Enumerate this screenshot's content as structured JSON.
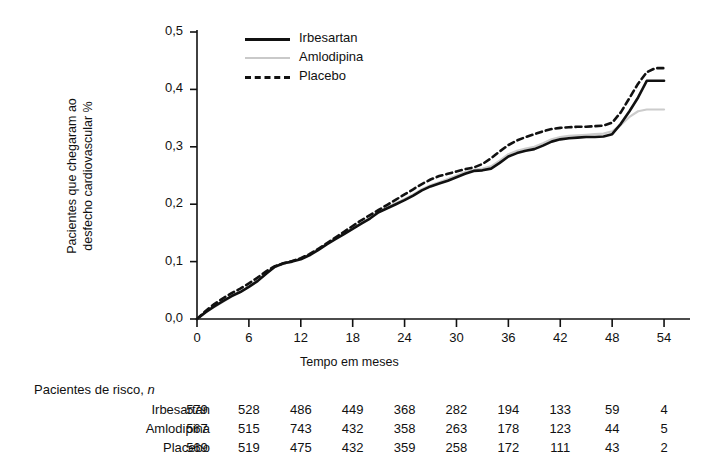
{
  "chart_data": {
    "type": "line",
    "title": "",
    "xlabel": "Tempo em meses",
    "ylabel": "Pacientes que chegaram ao\ndesfecho cardiovascular %",
    "xlim": [
      0,
      57
    ],
    "ylim": [
      0.0,
      0.5
    ],
    "xticks": [
      0,
      6,
      12,
      18,
      24,
      30,
      36,
      42,
      48,
      54
    ],
    "xtick_labels": [
      "0",
      "6",
      "12",
      "18",
      "24",
      "30",
      "36",
      "42",
      "48",
      "54"
    ],
    "yticks": [
      0.0,
      0.1,
      0.2,
      0.3,
      0.4,
      0.5
    ],
    "ytick_labels": [
      "0,0",
      "0,1",
      "0,2",
      "0,3",
      "0,4",
      "0,5"
    ],
    "grid": false,
    "legend_position": "top-left-inside",
    "series": [
      {
        "name": "Irbesartan",
        "style": "solid",
        "color": "#111111",
        "x": [
          0,
          1,
          2,
          3,
          4,
          5,
          6,
          7,
          8,
          9,
          10,
          11,
          12,
          13,
          14,
          15,
          16,
          17,
          18,
          19,
          20,
          21,
          22,
          23,
          24,
          25,
          26,
          27,
          28,
          29,
          30,
          31,
          32,
          33,
          34,
          35,
          36,
          37,
          38,
          39,
          40,
          41,
          42,
          43,
          44,
          45,
          46,
          47,
          48,
          49,
          50,
          51,
          52,
          53,
          54
        ],
        "y": [
          0.0,
          0.012,
          0.022,
          0.031,
          0.04,
          0.047,
          0.056,
          0.066,
          0.079,
          0.091,
          0.097,
          0.1,
          0.104,
          0.111,
          0.12,
          0.13,
          0.139,
          0.148,
          0.157,
          0.166,
          0.175,
          0.186,
          0.193,
          0.2,
          0.207,
          0.215,
          0.224,
          0.231,
          0.236,
          0.241,
          0.247,
          0.253,
          0.258,
          0.259,
          0.262,
          0.272,
          0.283,
          0.289,
          0.293,
          0.296,
          0.302,
          0.309,
          0.313,
          0.315,
          0.316,
          0.317,
          0.317,
          0.318,
          0.322,
          0.34,
          0.362,
          0.386,
          0.415,
          0.415,
          0.415
        ]
      },
      {
        "name": "Amlodipina",
        "style": "solid",
        "color": "#cccccc",
        "x": [
          0,
          1,
          2,
          3,
          4,
          5,
          6,
          7,
          8,
          9,
          10,
          11,
          12,
          13,
          14,
          15,
          16,
          17,
          18,
          19,
          20,
          21,
          22,
          23,
          24,
          25,
          26,
          27,
          28,
          29,
          30,
          31,
          32,
          33,
          34,
          35,
          36,
          37,
          38,
          39,
          40,
          41,
          42,
          43,
          44,
          45,
          46,
          47,
          48,
          49,
          50,
          51,
          52,
          53,
          54
        ],
        "y": [
          0.0,
          0.011,
          0.021,
          0.03,
          0.039,
          0.047,
          0.057,
          0.068,
          0.08,
          0.09,
          0.096,
          0.1,
          0.106,
          0.113,
          0.122,
          0.131,
          0.14,
          0.149,
          0.158,
          0.167,
          0.177,
          0.187,
          0.195,
          0.202,
          0.209,
          0.217,
          0.226,
          0.233,
          0.238,
          0.244,
          0.25,
          0.256,
          0.26,
          0.262,
          0.266,
          0.276,
          0.287,
          0.293,
          0.297,
          0.3,
          0.306,
          0.313,
          0.317,
          0.319,
          0.32,
          0.321,
          0.322,
          0.323,
          0.327,
          0.338,
          0.352,
          0.362,
          0.365,
          0.365,
          0.365
        ]
      },
      {
        "name": "Placebo",
        "style": "dashed",
        "color": "#111111",
        "x": [
          0,
          1,
          2,
          3,
          4,
          5,
          6,
          7,
          8,
          9,
          10,
          11,
          12,
          13,
          14,
          15,
          16,
          17,
          18,
          19,
          20,
          21,
          22,
          23,
          24,
          25,
          26,
          27,
          28,
          29,
          30,
          31,
          32,
          33,
          34,
          35,
          36,
          37,
          38,
          39,
          40,
          41,
          42,
          43,
          44,
          45,
          46,
          47,
          48,
          49,
          50,
          51,
          52,
          53,
          54
        ],
        "y": [
          0.0,
          0.014,
          0.026,
          0.036,
          0.045,
          0.053,
          0.062,
          0.072,
          0.083,
          0.092,
          0.097,
          0.101,
          0.106,
          0.113,
          0.122,
          0.132,
          0.142,
          0.152,
          0.162,
          0.172,
          0.181,
          0.19,
          0.199,
          0.208,
          0.217,
          0.226,
          0.235,
          0.243,
          0.249,
          0.253,
          0.257,
          0.261,
          0.264,
          0.27,
          0.28,
          0.292,
          0.303,
          0.311,
          0.317,
          0.322,
          0.327,
          0.331,
          0.333,
          0.334,
          0.335,
          0.335,
          0.336,
          0.337,
          0.342,
          0.36,
          0.385,
          0.41,
          0.43,
          0.437,
          0.437
        ]
      }
    ]
  },
  "legend": {
    "items": [
      {
        "label": "Irbesartan",
        "style": "solid",
        "color": "#111111"
      },
      {
        "label": "Amlodipina",
        "style": "solid-gray",
        "color": "#cccccc"
      },
      {
        "label": "Placebo",
        "style": "dashed",
        "color": "#111111"
      }
    ]
  },
  "risk_table": {
    "caption_text": "Pacientes de risco, ",
    "caption_italic": "n",
    "columns": [
      0,
      6,
      12,
      18,
      24,
      30,
      36,
      42,
      48,
      54
    ],
    "rows": [
      {
        "label": "Irbesartan",
        "values": [
          "579",
          "528",
          "486",
          "449",
          "368",
          "282",
          "194",
          "133",
          "59",
          "4"
        ]
      },
      {
        "label": "Amlodipina",
        "values": [
          "567",
          "515",
          "743",
          "432",
          "358",
          "263",
          "178",
          "123",
          "44",
          "5"
        ]
      },
      {
        "label": "Placebo",
        "values": [
          "569",
          "519",
          "475",
          "432",
          "359",
          "258",
          "172",
          "111",
          "43",
          "2"
        ]
      }
    ]
  }
}
